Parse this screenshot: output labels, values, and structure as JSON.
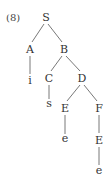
{
  "example_number": "(8)",
  "tree": {
    "nodes": [
      {
        "id": "S",
        "label": "S",
        "x": 46,
        "y": 21
      },
      {
        "id": "A",
        "label": "A",
        "x": 30,
        "y": 53
      },
      {
        "id": "B",
        "label": "B",
        "x": 64,
        "y": 53
      },
      {
        "id": "i",
        "label": "i",
        "x": 30,
        "y": 84
      },
      {
        "id": "C",
        "label": "C",
        "x": 49,
        "y": 82
      },
      {
        "id": "D",
        "label": "D",
        "x": 82,
        "y": 82
      },
      {
        "id": "s",
        "label": "s",
        "x": 49,
        "y": 107
      },
      {
        "id": "E1",
        "label": "E",
        "x": 65,
        "y": 112
      },
      {
        "id": "F",
        "label": "F",
        "x": 99,
        "y": 112
      },
      {
        "id": "e1",
        "label": "e",
        "x": 65,
        "y": 142
      },
      {
        "id": "E2",
        "label": "E",
        "x": 99,
        "y": 144
      },
      {
        "id": "e2",
        "label": "e",
        "x": 99,
        "y": 174
      }
    ],
    "edges": [
      [
        "S",
        "A"
      ],
      [
        "S",
        "B"
      ],
      [
        "A",
        "i"
      ],
      [
        "B",
        "C"
      ],
      [
        "B",
        "D"
      ],
      [
        "C",
        "s"
      ],
      [
        "D",
        "E1"
      ],
      [
        "D",
        "F"
      ],
      [
        "E1",
        "e1"
      ],
      [
        "F",
        "E2"
      ],
      [
        "E2",
        "e2"
      ]
    ]
  }
}
